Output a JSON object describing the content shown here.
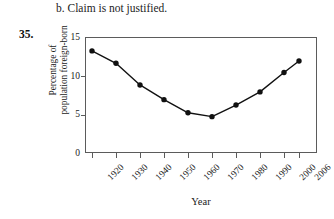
{
  "page": {
    "answer_line": "b. Claim is not justified.",
    "exercise_number": "35."
  },
  "chart_data": {
    "type": "line",
    "title": "",
    "xlabel": "Year",
    "ylabel": "Percentage of population foreign-born",
    "ylabel_line1": "Percentage of",
    "ylabel_line2": "population foreign-born",
    "categories": [
      "1920",
      "1930",
      "1940",
      "1950",
      "1960",
      "1970",
      "1980",
      "1990",
      "2000",
      "2006"
    ],
    "values": [
      13.2,
      11.6,
      8.8,
      6.9,
      5.2,
      4.7,
      6.2,
      7.9,
      10.4,
      11.9
    ],
    "yticks": [
      "0",
      "5",
      "10",
      "15"
    ],
    "ytick_values": [
      0,
      5,
      10,
      15
    ],
    "ylim": [
      0,
      15
    ],
    "xlim": [
      1916,
      2010
    ],
    "grid": false,
    "legend": "none",
    "marker": "filled-circle",
    "line_color": "#111111",
    "marker_color": "#111111",
    "frame_color": "#5b5b5b"
  }
}
